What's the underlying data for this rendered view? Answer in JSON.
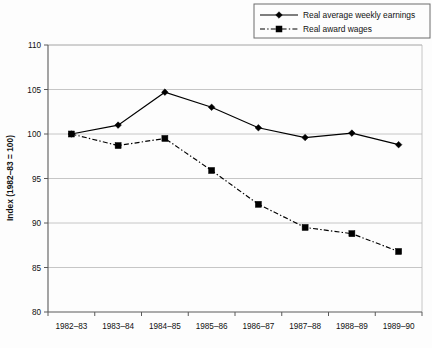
{
  "chart_data": {
    "type": "line",
    "title": "",
    "subtitle": "",
    "xlabel": "",
    "ylabel": "Index (1982–83 = 100)",
    "categories": [
      "1982–83",
      "1983–84",
      "1984–85",
      "1985–86",
      "1986–87",
      "1987–88",
      "1988–89",
      "1989–90"
    ],
    "ylim": [
      80,
      110
    ],
    "yticks": [
      80,
      85,
      90,
      95,
      100,
      105,
      110
    ],
    "ytick_labels": [
      "80",
      "85",
      "90",
      "95",
      "100",
      "105",
      "110"
    ],
    "grid": "horizontal",
    "legend_position": "top-right",
    "series": [
      {
        "name": "Real average weekly earnings",
        "marker": "diamond",
        "line_style": "solid",
        "color": "#000000",
        "values": [
          100.0,
          101.0,
          104.7,
          103.0,
          100.7,
          99.6,
          100.1,
          98.8
        ]
      },
      {
        "name": "Real award wages",
        "marker": "square",
        "line_style": "dash-dot",
        "color": "#000000",
        "values": [
          100.0,
          98.7,
          99.5,
          95.9,
          92.1,
          89.5,
          88.8,
          86.8
        ]
      }
    ]
  },
  "legend": {
    "items": [
      {
        "label": "Real average weekly earnings",
        "marker": "diamond",
        "line_style": "solid"
      },
      {
        "label": "Real award wages",
        "marker": "square",
        "line_style": "dash-dot"
      }
    ]
  },
  "colors": {
    "background": "#fdfdfd",
    "grid": "#b8b8b8",
    "axis": "#5a5a5a",
    "series": "#000000"
  }
}
